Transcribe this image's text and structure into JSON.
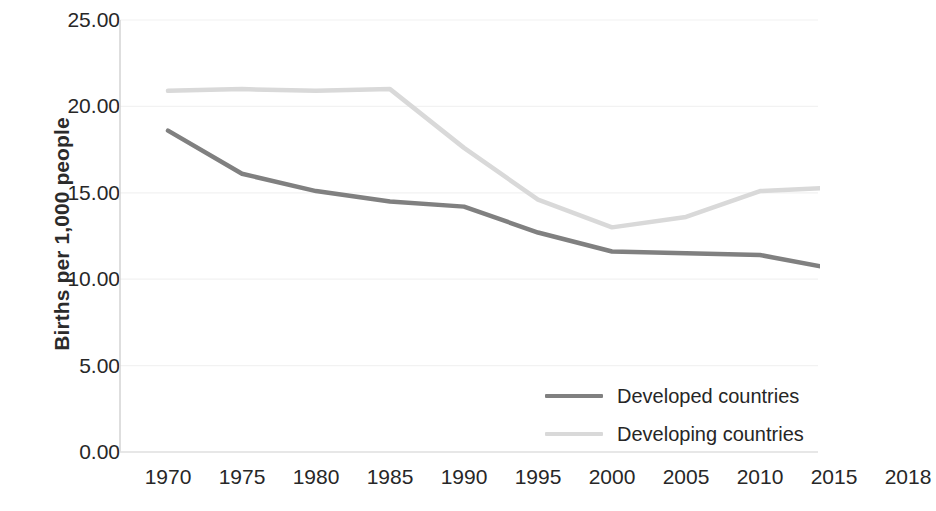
{
  "chart_data": {
    "type": "line",
    "title": "",
    "xlabel": "",
    "ylabel": "Births per 1,000 people",
    "categories": [
      "1970",
      "1975",
      "1980",
      "1985",
      "1990",
      "1995",
      "2000",
      "2005",
      "2010",
      "2015",
      "2018"
    ],
    "series": [
      {
        "name": "Developed countries",
        "color": "#808080",
        "values": [
          18.6,
          16.1,
          15.1,
          14.5,
          14.2,
          12.7,
          11.6,
          11.5,
          11.4,
          10.6,
          10.1
        ]
      },
      {
        "name": "Developing countries",
        "color": "#d9d9d9",
        "values": [
          20.9,
          21.0,
          20.9,
          21.0,
          17.6,
          14.6,
          13.0,
          13.6,
          15.1,
          15.3,
          14.1
        ]
      }
    ],
    "ylim": [
      0,
      25
    ],
    "y_ticks": [
      "0.00",
      "5.00",
      "10.00",
      "15.00",
      "20.00",
      "25.00"
    ],
    "y_tick_values": [
      0,
      5,
      10,
      15,
      20,
      25
    ],
    "grid": true,
    "grid_color": "#f2f2f2",
    "legend_position": "inside-bottom-right",
    "axis_color": "#d0d0d0",
    "background": "#ffffff"
  }
}
